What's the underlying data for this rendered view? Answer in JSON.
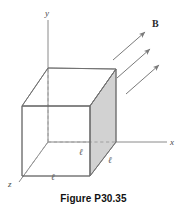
{
  "figure": {
    "caption": "Figure P30.35",
    "axes": {
      "y_label": "y",
      "x_label": "x",
      "z_label": "z"
    },
    "field": {
      "label": "B",
      "description": "uniform-magnetic-field-arrows",
      "arrow_count": 3,
      "direction": "up-and-to-the-right"
    },
    "cube": {
      "edge_labels": {
        "inner": "ℓ",
        "right_face": "ℓ",
        "bottom_front": "ℓ"
      },
      "shaded_face": "right",
      "shaded_face_color": "#d2d2d2",
      "edge_color": "#6e6e6e",
      "hidden_edge_style": "dashed"
    },
    "colors": {
      "background": "#ffffff",
      "line": "#8a8a8a",
      "caption": "#111111",
      "label": "#4a4a4a",
      "arrow": "#7a7a7a"
    }
  }
}
